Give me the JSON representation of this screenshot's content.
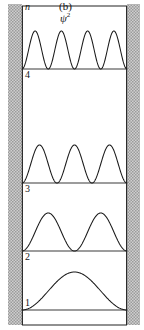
{
  "figure": {
    "panel_label": "(b)",
    "quantity_label": "ψ",
    "quantity_exponent": "2",
    "axis_label_n": "n",
    "wall_color": "#b0b0b0",
    "curve_color": "#1a1a1a",
    "baseline_color": "#3a3a3a",
    "background_color": "#ffffff"
  },
  "levels": [
    {
      "label": "4",
      "n": 4
    },
    {
      "label": "3",
      "n": 3
    },
    {
      "label": "2",
      "n": 2
    },
    {
      "label": "1",
      "n": 1
    }
  ],
  "chart_data": {
    "type": "line",
    "xlabel": "",
    "ylabel": "n",
    "xlim": [
      0,
      1
    ],
    "grid": false,
    "legend": "none",
    "well_left_x": 22,
    "well_right_x": 127,
    "series": [
      {
        "name": "n = 4",
        "n": 4,
        "lobes": 4,
        "baseline_y": 69,
        "amplitude_px": 38,
        "level_label": "4"
      },
      {
        "name": "n = 3",
        "n": 3,
        "lobes": 3,
        "baseline_y": 183,
        "amplitude_px": 38,
        "level_label": "3"
      },
      {
        "name": "n = 2",
        "n": 2,
        "lobes": 2,
        "baseline_y": 251,
        "amplitude_px": 38,
        "level_label": "2"
      },
      {
        "name": "n = 1",
        "n": 1,
        "lobes": 1,
        "baseline_y": 310,
        "amplitude_px": 38,
        "level_label": "1"
      }
    ],
    "frame": {
      "top_y": 6,
      "bottom_y": 325,
      "left_x": 22,
      "right_x": 127
    }
  }
}
